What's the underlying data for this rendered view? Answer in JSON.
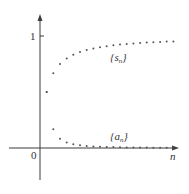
{
  "chart_data": {
    "type": "scatter",
    "title": "",
    "xlabel": "n",
    "ylabel": "",
    "origin_label": "0",
    "y_ticks": [
      {
        "value": 1,
        "label": "1"
      }
    ],
    "xlim": [
      0,
      20.5
    ],
    "ylim": [
      0,
      1
    ],
    "grid": false,
    "legend": "none",
    "annotations": [
      {
        "text": "{s",
        "sub": "n",
        "close": "}",
        "series": "s_n"
      },
      {
        "text": "{a",
        "sub": "n",
        "close": "}",
        "series": "a_n"
      }
    ],
    "x": [
      1,
      2,
      3,
      4,
      5,
      6,
      7,
      8,
      9,
      10,
      11,
      12,
      13,
      14,
      15,
      16,
      17,
      18,
      19,
      20
    ],
    "series": [
      {
        "name": "{s_n}",
        "values": [
          0.5,
          0.667,
          0.75,
          0.8,
          0.833,
          0.857,
          0.875,
          0.889,
          0.9,
          0.909,
          0.917,
          0.923,
          0.929,
          0.933,
          0.938,
          0.941,
          0.944,
          0.947,
          0.95,
          0.952
        ]
      },
      {
        "name": "{a_n}",
        "values": [
          0.5,
          0.167,
          0.083,
          0.05,
          0.033,
          0.024,
          0.018,
          0.014,
          0.011,
          0.009,
          0.008,
          0.006,
          0.005,
          0.005,
          0.004,
          0.004,
          0.003,
          0.003,
          0.003,
          0.002
        ]
      }
    ]
  },
  "colors": {
    "axis": "#3a3a3a",
    "dot": "#555555",
    "text": "#333333"
  }
}
